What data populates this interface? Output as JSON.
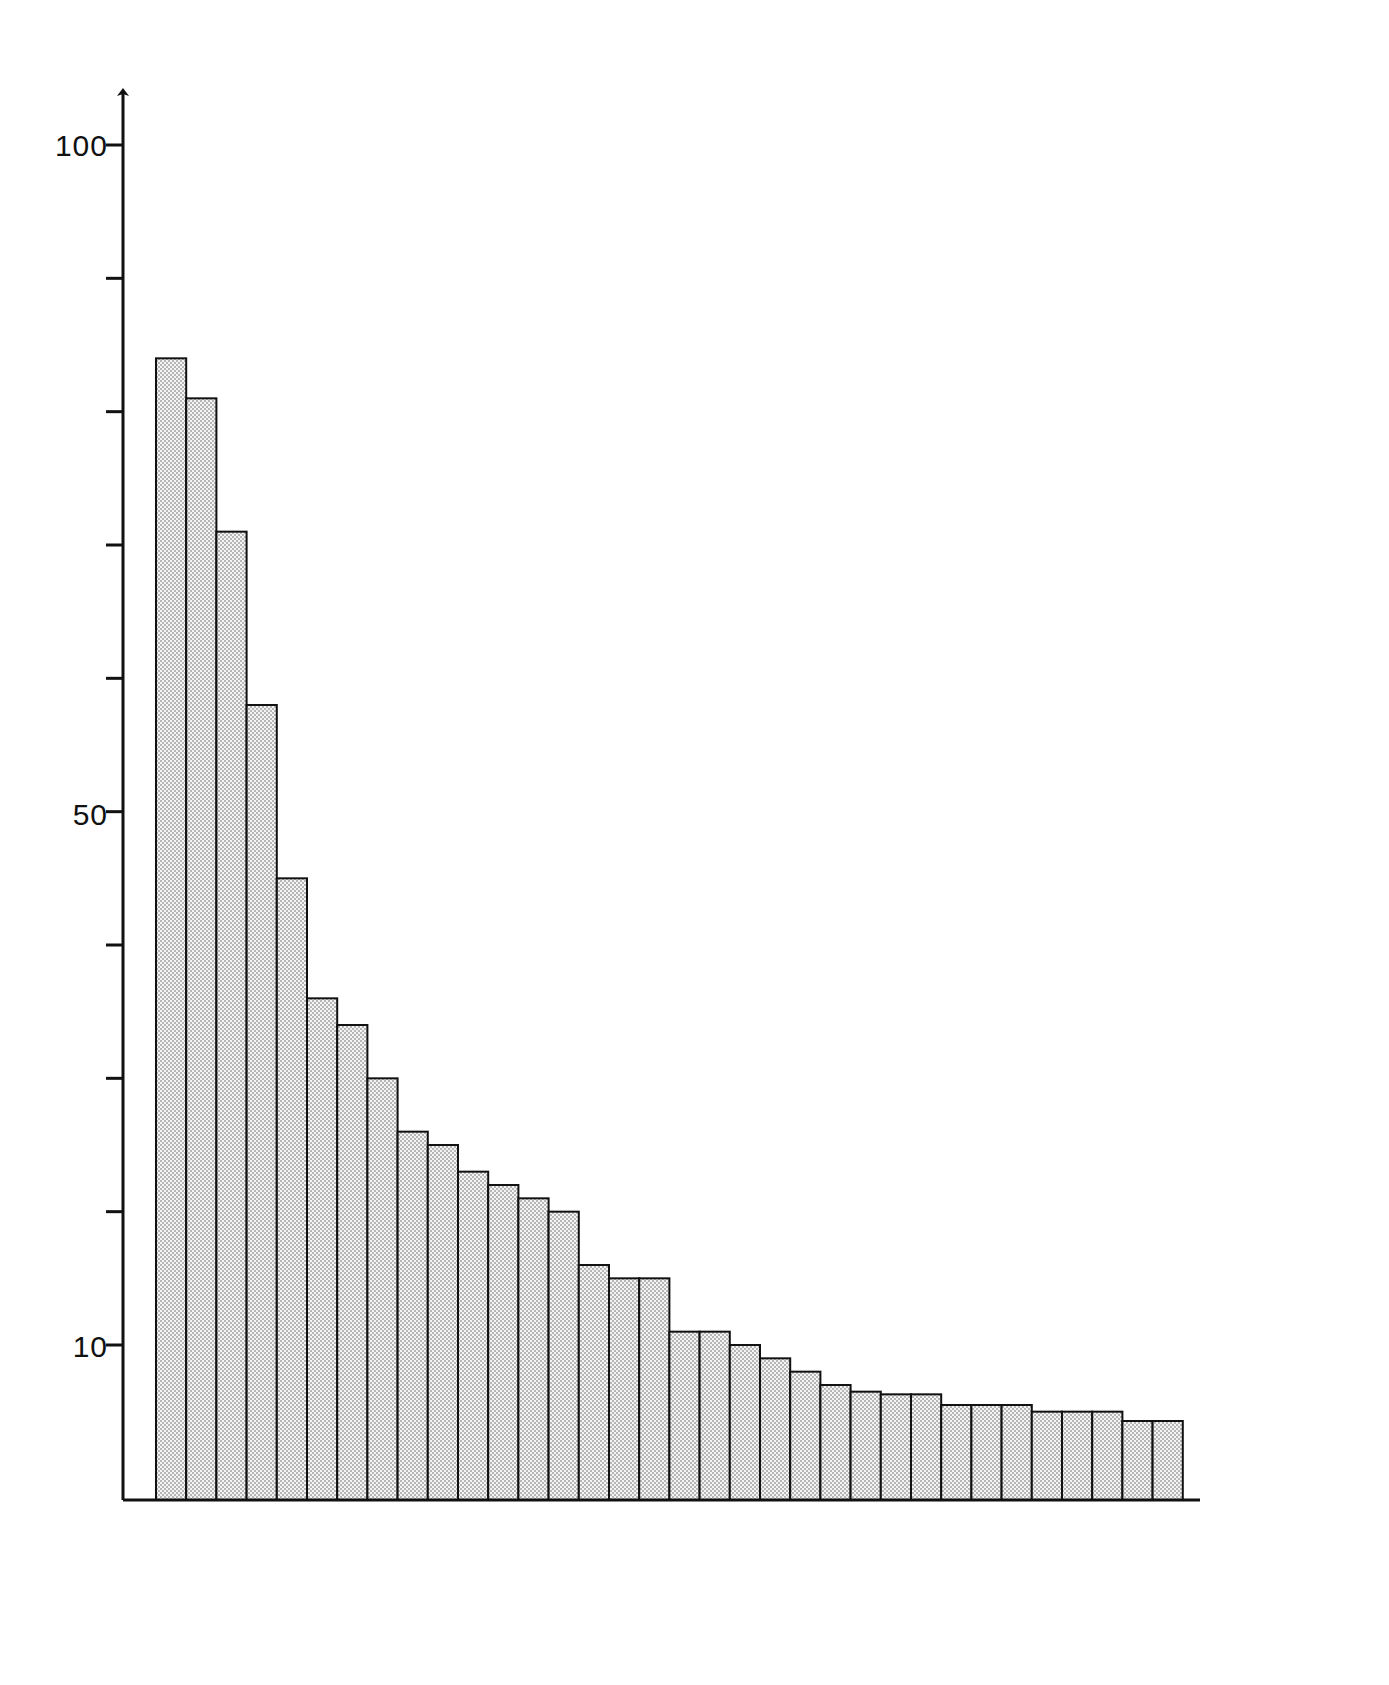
{
  "chart_data": {
    "type": "bar",
    "title": "",
    "subtitle": "",
    "xlabel": "",
    "ylabel": "",
    "grid": false,
    "legend": "none",
    "axis": {
      "y_ticks_labeled": [
        100,
        50,
        10
      ],
      "y_ticks_all": [
        100,
        90,
        80,
        70,
        60,
        50,
        40,
        30,
        20,
        10
      ],
      "ylim": [
        0,
        108
      ],
      "y_axis_has_arrow": true,
      "x_axis_visible": true,
      "x_ticks": []
    },
    "categories": [
      "1",
      "2",
      "3",
      "4",
      "5",
      "6",
      "7",
      "8",
      "9",
      "10",
      "11",
      "12",
      "13",
      "14",
      "15",
      "16",
      "17",
      "18",
      "19",
      "20",
      "21",
      "22",
      "23",
      "24",
      "25",
      "26",
      "27",
      "28",
      "29",
      "30",
      "31",
      "32",
      "33",
      "34"
    ],
    "values": [
      84,
      81,
      71,
      58,
      45,
      36,
      34,
      30,
      26,
      25,
      23,
      22,
      21,
      20,
      16,
      15,
      15,
      11,
      11,
      10,
      9,
      8,
      7,
      6.5,
      6.3,
      6.3,
      5.5,
      5.5,
      5.5,
      5,
      5,
      5,
      4.3,
      4.3
    ],
    "bar_style": {
      "fill": "stipple-dot",
      "fill_color": "#f2f2f2",
      "dot_color": "#555555",
      "edge_color": "#111111",
      "edge_width": 2
    }
  },
  "labels": {
    "tick_100": "100",
    "tick_50": "50",
    "tick_10": "10"
  },
  "colors": {
    "background": "#ffffff",
    "ink": "#111111",
    "bar_fill": "#f2f2f2"
  }
}
